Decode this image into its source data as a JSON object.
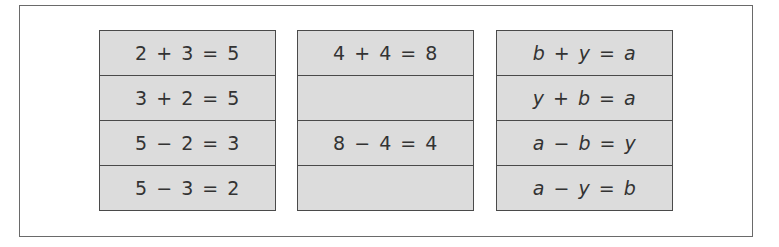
{
  "diagram": {
    "title": "",
    "fact_families": [
      {
        "id": "family-2-3-5",
        "rows": [
          "2 + 3 = 5",
          "3 + 2 = 5",
          "5 − 2 = 3",
          "5 − 3 = 2"
        ]
      },
      {
        "id": "family-4-4-8",
        "rows": [
          "4 + 4 = 8",
          "",
          "8 − 4 = 4",
          ""
        ]
      },
      {
        "id": "family-a-b-y",
        "rows": [
          "b + y = a",
          "y + b = a",
          "a − b = y",
          "a − y = b"
        ]
      }
    ]
  },
  "colors": {
    "frame_border": "#6a6a6a",
    "box_border": "#4a4a4a",
    "box_fill": "#dcdcdc",
    "text": "#333333",
    "background": "#ffffff"
  }
}
